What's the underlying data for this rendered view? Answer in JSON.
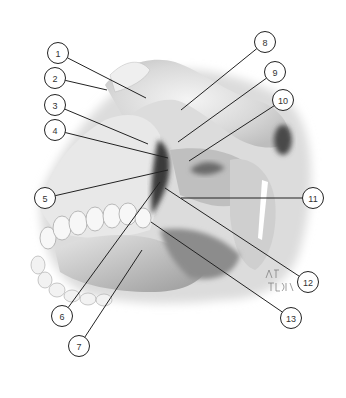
{
  "figure": {
    "type": "anatomical-illustration",
    "artist_signature": "PAT THOMAS",
    "colors": {
      "line": "#222222",
      "circle_fill": "#ffffff",
      "bone_light": "#eeeeee",
      "bone_mid": "#c8c8c8",
      "bone_dark": "#555555"
    },
    "callouts": [
      {
        "label": "1",
        "cx": 58,
        "cy": 53,
        "tx": 146,
        "ty": 98
      },
      {
        "label": "2",
        "cx": 55,
        "cy": 78,
        "tx": 107,
        "ty": 90
      },
      {
        "label": "3",
        "cx": 55,
        "cy": 105,
        "tx": 148,
        "ty": 144
      },
      {
        "label": "4",
        "cx": 55,
        "cy": 130,
        "tx": 168,
        "ty": 158
      },
      {
        "label": "5",
        "cx": 45,
        "cy": 198,
        "tx": 168,
        "ty": 170
      },
      {
        "label": "6",
        "cx": 62,
        "cy": 316,
        "tx": 160,
        "ty": 182
      },
      {
        "label": "7",
        "cx": 79,
        "cy": 346,
        "tx": 142,
        "ty": 250
      },
      {
        "label": "8",
        "cx": 265,
        "cy": 42,
        "tx": 181,
        "ty": 110
      },
      {
        "label": "9",
        "cx": 275,
        "cy": 72,
        "tx": 178,
        "ty": 142
      },
      {
        "label": "10",
        "cx": 283,
        "cy": 100,
        "tx": 189,
        "ty": 161
      },
      {
        "label": "11",
        "cx": 313,
        "cy": 198,
        "tx": 181,
        "ty": 198
      },
      {
        "label": "12",
        "cx": 308,
        "cy": 282,
        "tx": 165,
        "ty": 188
      },
      {
        "label": "13",
        "cx": 291,
        "cy": 318,
        "tx": 151,
        "ty": 222
      }
    ]
  }
}
